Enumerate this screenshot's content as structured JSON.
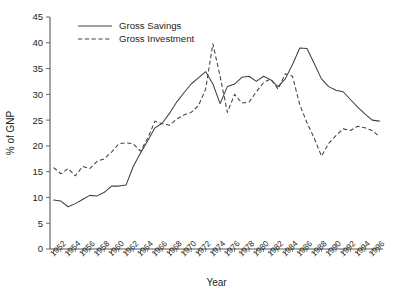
{
  "chart_data": {
    "type": "line",
    "title": "",
    "xlabel": "Year",
    "ylabel": "% of GNP",
    "xlim": [
      1951.5,
      1997.5
    ],
    "ylim": [
      0,
      45
    ],
    "yticks": [
      0,
      5,
      10,
      15,
      20,
      25,
      30,
      35,
      40,
      45
    ],
    "grid": false,
    "legend_position": "top-left",
    "x": [
      1952,
      1953,
      1954,
      1955,
      1956,
      1957,
      1958,
      1959,
      1960,
      1961,
      1962,
      1963,
      1964,
      1965,
      1966,
      1967,
      1968,
      1969,
      1970,
      1971,
      1972,
      1973,
      1974,
      1975,
      1976,
      1977,
      1978,
      1979,
      1980,
      1981,
      1982,
      1983,
      1984,
      1985,
      1986,
      1987,
      1988,
      1989,
      1990,
      1991,
      1992,
      1993,
      1994,
      1995,
      1996,
      1997
    ],
    "xtick_labels": [
      "1952",
      "1954",
      "1956",
      "1958",
      "1960",
      "1962",
      "1964",
      "1966",
      "1968",
      "1970",
      "1972",
      "1974",
      "1976",
      "1978",
      "1980",
      "1982",
      "1984",
      "1986",
      "1988",
      "1990",
      "1992",
      "1994",
      "1996"
    ],
    "series": [
      {
        "name": "Gross Savings",
        "style": "solid",
        "color": "#404042",
        "values": [
          9.5,
          9.3,
          8.2,
          8.8,
          9.6,
          10.4,
          10.3,
          11.0,
          12.2,
          12.2,
          12.4,
          16.0,
          18.6,
          21.0,
          23.5,
          24.4,
          26.3,
          28.5,
          30.3,
          32.0,
          33.2,
          34.4,
          32.0,
          28.2,
          31.5,
          32.0,
          33.3,
          33.5,
          32.5,
          33.5,
          32.8,
          31.5,
          33.0,
          35.8,
          39.0,
          38.9,
          36.0,
          33.0,
          31.5,
          30.8,
          30.5,
          29.0,
          27.5,
          26.2,
          25.0,
          24.8
        ]
      },
      {
        "name": "Gross Investment",
        "style": "dashed",
        "color": "#404042",
        "values": [
          15.8,
          14.6,
          15.6,
          14.2,
          16.0,
          15.6,
          17.0,
          17.5,
          18.8,
          20.4,
          20.6,
          20.4,
          19.0,
          21.5,
          24.8,
          24.3,
          24.0,
          25.2,
          26.0,
          26.5,
          27.8,
          31.0,
          39.8,
          33.5,
          26.5,
          30.0,
          28.3,
          28.5,
          30.5,
          32.3,
          33.0,
          31.0,
          34.0,
          33.5,
          28.0,
          24.5,
          21.5,
          18.0,
          20.5,
          22.0,
          23.3,
          23.0,
          23.8,
          23.5,
          23.0,
          21.8
        ]
      }
    ]
  },
  "legend": {
    "items": [
      {
        "label": "Gross Savings",
        "style": "solid"
      },
      {
        "label": "Gross Investment",
        "style": "dashed"
      }
    ]
  }
}
